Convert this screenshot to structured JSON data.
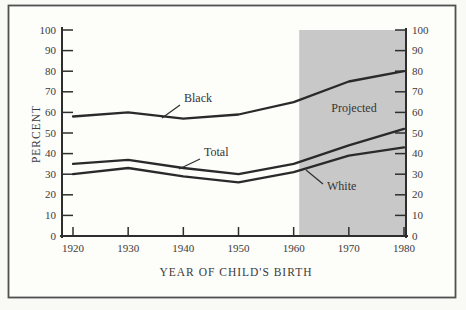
{
  "chart_data": {
    "type": "line",
    "title": "",
    "xlabel": "YEAR OF CHILD'S BIRTH",
    "ylabel": "PERCENT",
    "x": [
      1920,
      1930,
      1940,
      1950,
      1960,
      1970,
      1980
    ],
    "xlim": [
      1920,
      1980
    ],
    "ylim": [
      0,
      100
    ],
    "ytick_step": 10,
    "y_axis_sides": [
      "left",
      "right"
    ],
    "grid": false,
    "legend_position": "inline-annotations",
    "series": [
      {
        "name": "Black",
        "values": [
          58,
          60,
          57,
          59,
          65,
          75,
          80
        ]
      },
      {
        "name": "Total",
        "values": [
          35,
          37,
          33,
          30,
          35,
          44,
          52
        ]
      },
      {
        "name": "White",
        "values": [
          30,
          33,
          29,
          26,
          31,
          39,
          43
        ]
      }
    ],
    "projected_region": {
      "label": "Projected",
      "x_start": 1961,
      "x_end": 1980,
      "fill": "#c8c8c8"
    },
    "colors": {
      "line": "#2a2a2a",
      "axis": "#2e2e2e",
      "frame": "#505050",
      "background": "#fdfdfa",
      "shading": "#c8c8c8",
      "text": "#3b3b3b"
    }
  }
}
